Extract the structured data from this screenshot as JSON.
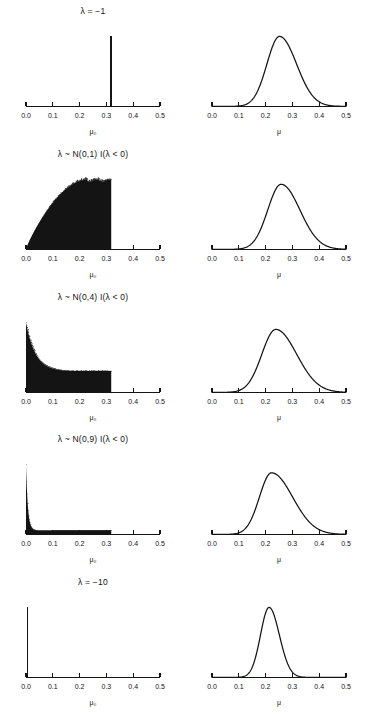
{
  "figure": {
    "axis_labels": {
      "left": "μ₀",
      "right": "μ"
    },
    "tick_labels": [
      "0.0",
      "0.1",
      "0.2",
      "0.3",
      "0.4",
      "0.5"
    ]
  },
  "chart_data": {
    "type": "area",
    "title": "",
    "layout": {
      "rows": 5,
      "cols": 2,
      "grid": false,
      "legend": "none"
    },
    "xlim": [
      0.0,
      0.5
    ],
    "xticks": [
      0.0,
      0.1,
      0.2,
      0.3,
      0.4,
      0.5
    ],
    "xlabel_left": "μ₀",
    "xlabel_right": "μ",
    "ylabel": "",
    "panels": [
      {
        "row": 1,
        "title": "λ = −1",
        "left": {
          "kind": "spike",
          "xlabel": "μ₀",
          "spike_x": 0.317,
          "spike_height": 1.0,
          "description": "degenerate point mass at 0.317"
        },
        "right": {
          "kind": "density",
          "xlabel": "μ",
          "mode": 0.252,
          "peak_height": 1.0,
          "spread": 0.047,
          "skew": 0.35,
          "support": [
            0.1,
            0.46
          ]
        }
      },
      {
        "row": 2,
        "title": "λ ~ N(0,1) I(λ < 0)",
        "left": {
          "kind": "histogram",
          "xlabel": "μ₀",
          "shape": "rising-plateau",
          "cutoff_x": 0.318,
          "peak_height": 1.0,
          "description": "density rises steeply from 0, broad plateau, sharp truncation at 0.318"
        },
        "right": {
          "kind": "density",
          "xlabel": "μ",
          "mode": 0.258,
          "peak_height": 0.93,
          "spread": 0.05,
          "skew": 0.4,
          "support": [
            0.09,
            0.47
          ]
        }
      },
      {
        "row": 3,
        "title": "λ ~ N(0,4) I(λ < 0)",
        "left": {
          "kind": "histogram",
          "xlabel": "μ₀",
          "shape": "decaying-plateau",
          "cutoff_x": 0.318,
          "peak_height": 1.0,
          "description": "peak at 0 decaying to a flat plateau, truncated at 0.318"
        },
        "right": {
          "kind": "density",
          "xlabel": "μ",
          "mode": 0.238,
          "peak_height": 0.9,
          "spread": 0.052,
          "skew": 0.5,
          "support": [
            0.07,
            0.47
          ]
        }
      },
      {
        "row": 4,
        "title": "λ ~ N(0,9) I(λ < 0)",
        "left": {
          "kind": "histogram",
          "xlabel": "μ₀",
          "shape": "spike-with-tail",
          "cutoff_x": 0.318,
          "peak_height": 1.0,
          "description": "sharp spike at 0 with long thin tail truncated at 0.318"
        },
        "right": {
          "kind": "density",
          "xlabel": "μ",
          "mode": 0.222,
          "peak_height": 0.88,
          "spread": 0.045,
          "skew": 0.75,
          "support": [
            0.06,
            0.48
          ]
        }
      },
      {
        "row": 5,
        "title": "λ = −10",
        "left": {
          "kind": "spike",
          "xlabel": "μ₀",
          "spike_x": 0.006,
          "spike_height": 1.0,
          "description": "degenerate point mass at ~0"
        },
        "right": {
          "kind": "density",
          "xlabel": "μ",
          "mode": 0.213,
          "peak_height": 1.0,
          "spread": 0.032,
          "skew": 0.2,
          "support": [
            0.1,
            0.42
          ]
        }
      }
    ]
  }
}
